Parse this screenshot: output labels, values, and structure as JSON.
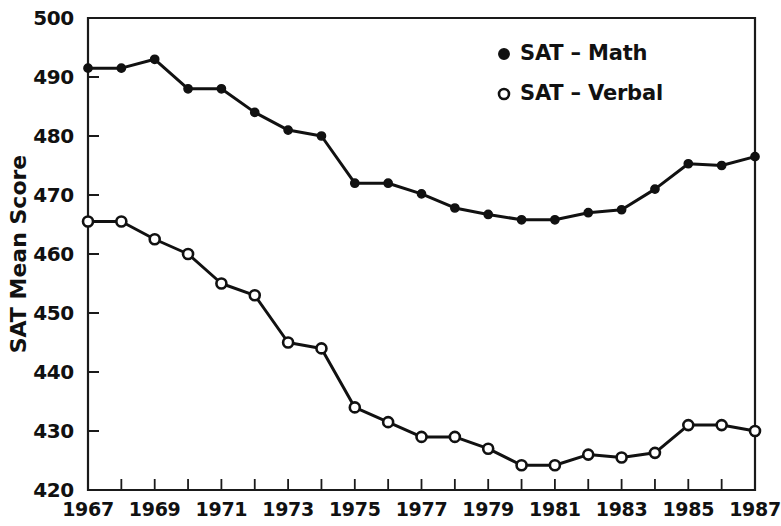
{
  "chart_data": {
    "type": "line",
    "title": "",
    "xlabel": "",
    "ylabel": "SAT Mean Score",
    "xlim": [
      1967,
      1987
    ],
    "ylim": [
      420,
      500
    ],
    "yticks": [
      420,
      430,
      440,
      450,
      460,
      470,
      480,
      490,
      500
    ],
    "xticks": [
      1967,
      1968,
      1969,
      1970,
      1971,
      1972,
      1973,
      1974,
      1975,
      1976,
      1977,
      1978,
      1979,
      1980,
      1981,
      1982,
      1983,
      1984,
      1985,
      1986,
      1987
    ],
    "xtick_labels_shown": [
      1967,
      1969,
      1971,
      1973,
      1975,
      1977,
      1979,
      1981,
      1983,
      1985,
      1987
    ],
    "grid": false,
    "legend_position": "top-right",
    "x": [
      1967,
      1968,
      1969,
      1970,
      1971,
      1972,
      1973,
      1974,
      1975,
      1976,
      1977,
      1978,
      1979,
      1980,
      1981,
      1982,
      1983,
      1984,
      1985,
      1986,
      1987
    ],
    "series": [
      {
        "name": "SAT - Math",
        "marker": "filled-circle",
        "color": "#111111",
        "values": [
          491.5,
          491.5,
          493.0,
          488.0,
          488.0,
          484.0,
          481.0,
          480.0,
          472.0,
          472.0,
          470.2,
          467.8,
          466.7,
          465.8,
          465.8,
          467.0,
          467.5,
          471.0,
          475.3,
          475.0,
          476.5
        ]
      },
      {
        "name": "SAT - Verbal",
        "marker": "open-circle",
        "color": "#111111",
        "values": [
          465.5,
          465.5,
          462.5,
          460.0,
          455.0,
          453.0,
          445.0,
          444.0,
          434.0,
          431.5,
          429.0,
          429.0,
          427.0,
          424.2,
          424.2,
          426.0,
          425.5,
          426.3,
          431.0,
          431.0,
          430.0
        ]
      }
    ]
  },
  "legend": {
    "entries": [
      {
        "marker": "filled-circle",
        "label": "SAT – Math"
      },
      {
        "marker": "open-circle",
        "label": "SAT – Verbal"
      }
    ]
  },
  "axes": {
    "y_title": "SAT Mean Score",
    "y_labels": [
      "500",
      "490",
      "480",
      "470",
      "460",
      "450",
      "440",
      "430",
      "420"
    ],
    "x_labels": [
      "1967",
      "1969",
      "1971",
      "1973",
      "1975",
      "1977",
      "1979",
      "1981",
      "1983",
      "1985",
      "1987"
    ]
  }
}
